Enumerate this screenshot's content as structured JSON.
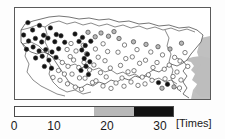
{
  "figure": {
    "title": ""
  },
  "map": {
    "name": "kanto-region-map",
    "land_color": "#ffffff",
    "water_color": "#bdbdbd",
    "outline_color": "#3a3a3a",
    "frame_color": "#5a5a5a"
  },
  "legend": {
    "orientation": "horizontal",
    "unit_label": "[Times]",
    "tick_labels": [
      "0",
      "10",
      "20",
      "30"
    ],
    "tick_values": [
      0,
      10,
      20,
      30
    ],
    "segment_colors": [
      "#ffffff",
      "#ffffff",
      "#b8b8b8",
      "#121212"
    ],
    "segment_ranges": [
      [
        0,
        7.5
      ],
      [
        7.5,
        15
      ],
      [
        15,
        22.5
      ],
      [
        22.5,
        30
      ]
    ]
  },
  "chart_data": {
    "type": "scatter",
    "title": "",
    "xlabel": "",
    "ylabel": "",
    "colorbar_label": "[Times]",
    "colorbar_ticks": [
      0,
      10,
      20,
      30
    ],
    "colorbar_range": [
      0,
      30
    ],
    "marker_shape": "circle",
    "marker_edge_color": "#333333",
    "points": [
      {
        "x": 12.9,
        "y": 14.6,
        "v": 27
      },
      {
        "x": 17.6,
        "y": 22.0,
        "v": 28
      },
      {
        "x": 24.5,
        "y": 17.4,
        "v": 26
      },
      {
        "x": 28.6,
        "y": 27.3,
        "v": 27
      },
      {
        "x": 35.4,
        "y": 19.9,
        "v": 28
      },
      {
        "x": 41.3,
        "y": 26.5,
        "v": 26
      },
      {
        "x": 8.6,
        "y": 27.0,
        "v": 27
      },
      {
        "x": 13.6,
        "y": 33.0,
        "v": 29
      },
      {
        "x": 20.4,
        "y": 30.4,
        "v": 28
      },
      {
        "x": 26.7,
        "y": 34.0,
        "v": 27
      },
      {
        "x": 33.0,
        "y": 30.1,
        "v": 28
      },
      {
        "x": 39.8,
        "y": 33.7,
        "v": 26
      },
      {
        "x": 46.0,
        "y": 27.8,
        "v": 27
      },
      {
        "x": 49.7,
        "y": 34.3,
        "v": 26
      },
      {
        "x": 11.5,
        "y": 41.3,
        "v": 27
      },
      {
        "x": 18.1,
        "y": 39.0,
        "v": 28
      },
      {
        "x": 24.1,
        "y": 42.9,
        "v": 26
      },
      {
        "x": 30.8,
        "y": 41.6,
        "v": 27
      },
      {
        "x": 37.0,
        "y": 44.0,
        "v": 28
      },
      {
        "x": 43.6,
        "y": 40.8,
        "v": 26
      },
      {
        "x": 20.6,
        "y": 50.0,
        "v": 27
      },
      {
        "x": 27.2,
        "y": 48.2,
        "v": 26
      },
      {
        "x": 33.9,
        "y": 52.1,
        "v": 27
      },
      {
        "x": 41.0,
        "y": 49.4,
        "v": 26
      },
      {
        "x": 29.4,
        "y": 58.4,
        "v": 25
      },
      {
        "x": 36.5,
        "y": 60.2,
        "v": 24
      },
      {
        "x": 52.1,
        "y": 41.5,
        "v": 12
      },
      {
        "x": 55.2,
        "y": 48.6,
        "v": 11
      },
      {
        "x": 47.3,
        "y": 54.5,
        "v": 13
      },
      {
        "x": 53.0,
        "y": 58.3,
        "v": 10
      },
      {
        "x": 43.5,
        "y": 62.5,
        "v": 11
      },
      {
        "x": 49.4,
        "y": 66.0,
        "v": 12
      },
      {
        "x": 38.0,
        "y": 69.4,
        "v": 10
      },
      {
        "x": 45.0,
        "y": 72.3,
        "v": 11
      },
      {
        "x": 56.0,
        "y": 35.5,
        "v": 13
      },
      {
        "x": 61.0,
        "y": 43.0,
        "v": 12
      },
      {
        "x": 58.6,
        "y": 52.0,
        "v": 11
      },
      {
        "x": 63.8,
        "y": 59.5,
        "v": 10
      },
      {
        "x": 57.0,
        "y": 66.1,
        "v": 12
      },
      {
        "x": 64.5,
        "y": 69.9,
        "v": 11
      },
      {
        "x": 52.5,
        "y": 75.8,
        "v": 9
      },
      {
        "x": 60.3,
        "y": 79.1,
        "v": 10
      },
      {
        "x": 68.2,
        "y": 37.3,
        "v": 13
      },
      {
        "x": 71.5,
        "y": 45.8,
        "v": 11
      },
      {
        "x": 69.0,
        "y": 54.4,
        "v": 12
      },
      {
        "x": 74.6,
        "y": 62.0,
        "v": 10
      },
      {
        "x": 70.0,
        "y": 70.2,
        "v": 11
      },
      {
        "x": 77.5,
        "y": 74.5,
        "v": 9
      },
      {
        "x": 66.5,
        "y": 81.3,
        "v": 10
      },
      {
        "x": 80.4,
        "y": 41.0,
        "v": 14
      },
      {
        "x": 83.2,
        "y": 49.2,
        "v": 12
      },
      {
        "x": 78.9,
        "y": 57.0,
        "v": 13
      },
      {
        "x": 85.5,
        "y": 64.6,
        "v": 11
      },
      {
        "x": 81.0,
        "y": 72.8,
        "v": 12
      },
      {
        "x": 88.1,
        "y": 35.8,
        "v": 14
      },
      {
        "x": 92.6,
        "y": 43.5,
        "v": 13
      },
      {
        "x": 90.0,
        "y": 52.7,
        "v": 12
      },
      {
        "x": 95.3,
        "y": 60.1,
        "v": 11
      },
      {
        "x": 91.2,
        "y": 68.9,
        "v": 10
      },
      {
        "x": 60.0,
        "y": 26.0,
        "v": 24
      },
      {
        "x": 67.5,
        "y": 29.4,
        "v": 23
      },
      {
        "x": 73.0,
        "y": 24.3,
        "v": 20
      },
      {
        "x": 80.2,
        "y": 28.8,
        "v": 22
      },
      {
        "x": 86.0,
        "y": 25.0,
        "v": 19
      },
      {
        "x": 93.5,
        "y": 28.2,
        "v": 18
      },
      {
        "x": 99.0,
        "y": 23.6,
        "v": 17
      },
      {
        "x": 64.0,
        "y": 33.4,
        "v": 26
      },
      {
        "x": 70.3,
        "y": 37.5,
        "v": 27
      },
      {
        "x": 75.8,
        "y": 33.2,
        "v": 24
      },
      {
        "x": 66.8,
        "y": 42.0,
        "v": 28
      },
      {
        "x": 72.4,
        "y": 46.2,
        "v": 29
      },
      {
        "x": 69.2,
        "y": 50.5,
        "v": 27
      },
      {
        "x": 74.8,
        "y": 53.8,
        "v": 26
      },
      {
        "x": 71.0,
        "y": 58.3,
        "v": 28
      },
      {
        "x": 66.0,
        "y": 62.4,
        "v": 25
      },
      {
        "x": 73.5,
        "y": 66.5,
        "v": 27
      },
      {
        "x": 104.0,
        "y": 30.5,
        "v": 16
      },
      {
        "x": 109.5,
        "y": 37.0,
        "v": 14
      },
      {
        "x": 103.0,
        "y": 44.2,
        "v": 13
      },
      {
        "x": 110.8,
        "y": 50.6,
        "v": 12
      },
      {
        "x": 105.5,
        "y": 57.4,
        "v": 13
      },
      {
        "x": 113.0,
        "y": 63.8,
        "v": 11
      },
      {
        "x": 107.0,
        "y": 70.0,
        "v": 12
      },
      {
        "x": 118.5,
        "y": 33.8,
        "v": 15
      },
      {
        "x": 122.0,
        "y": 41.6,
        "v": 13
      },
      {
        "x": 117.3,
        "y": 48.9,
        "v": 14
      },
      {
        "x": 124.6,
        "y": 55.3,
        "v": 12
      },
      {
        "x": 119.0,
        "y": 62.7,
        "v": 13
      },
      {
        "x": 127.2,
        "y": 69.1,
        "v": 11
      },
      {
        "x": 131.0,
        "y": 36.4,
        "v": 16
      },
      {
        "x": 135.8,
        "y": 44.0,
        "v": 14
      },
      {
        "x": 130.5,
        "y": 52.2,
        "v": 13
      },
      {
        "x": 138.0,
        "y": 59.5,
        "v": 12
      },
      {
        "x": 133.4,
        "y": 66.8,
        "v": 13
      },
      {
        "x": 143.0,
        "y": 38.7,
        "v": 15
      },
      {
        "x": 147.5,
        "y": 46.9,
        "v": 13
      },
      {
        "x": 142.0,
        "y": 54.5,
        "v": 14
      },
      {
        "x": 149.3,
        "y": 61.2,
        "v": 12
      },
      {
        "x": 155.0,
        "y": 41.0,
        "v": 16
      },
      {
        "x": 159.6,
        "y": 49.4,
        "v": 14
      },
      {
        "x": 154.2,
        "y": 57.1,
        "v": 13
      },
      {
        "x": 162.0,
        "y": 64.0,
        "v": 12
      },
      {
        "x": 166.5,
        "y": 35.2,
        "v": 15
      },
      {
        "x": 170.0,
        "y": 44.6,
        "v": 13
      },
      {
        "x": 165.0,
        "y": 53.0,
        "v": 14
      },
      {
        "x": 172.8,
        "y": 58.4,
        "v": 12
      },
      {
        "x": 158.0,
        "y": 68.5,
        "v": 11
      },
      {
        "x": 166.0,
        "y": 72.0,
        "v": 12
      },
      {
        "x": 150.0,
        "y": 70.8,
        "v": 13
      },
      {
        "x": 143.5,
        "y": 74.6,
        "v": 26
      },
      {
        "x": 137.0,
        "y": 72.3,
        "v": 14
      },
      {
        "x": 130.0,
        "y": 75.9,
        "v": 13
      },
      {
        "x": 123.0,
        "y": 77.4,
        "v": 12
      },
      {
        "x": 116.0,
        "y": 74.0,
        "v": 13
      },
      {
        "x": 109.0,
        "y": 78.2,
        "v": 11
      },
      {
        "x": 101.0,
        "y": 75.0,
        "v": 12
      },
      {
        "x": 96.0,
        "y": 80.4,
        "v": 10
      },
      {
        "x": 88.0,
        "y": 78.0,
        "v": 11
      },
      {
        "x": 152.5,
        "y": 76.3,
        "v": 27
      },
      {
        "x": 147.0,
        "y": 80.2,
        "v": 22
      },
      {
        "x": 159.0,
        "y": 78.9,
        "v": 19
      },
      {
        "x": 164.5,
        "y": 80.0,
        "v": 14
      }
    ]
  }
}
